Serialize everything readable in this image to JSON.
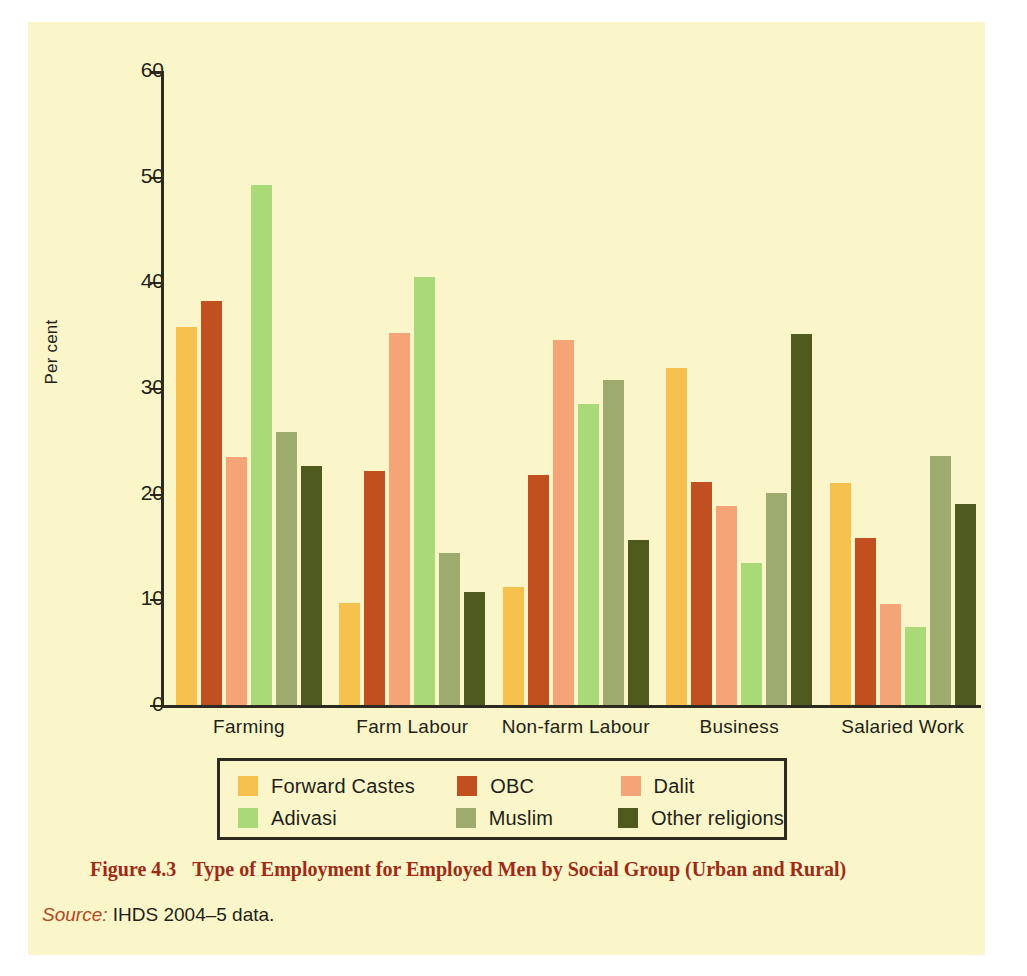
{
  "figure": {
    "caption_number": "Figure 4.3",
    "caption_text": "Type of Employment for Employed Men by Social Group (Urban and Rural)",
    "source_label": "Source:",
    "source_text": "IHDS 2004–5 data."
  },
  "colors": {
    "panel_background": "#fbf6c9",
    "axis": "#2d2a20",
    "caption": "#9e2b16",
    "text": "#231f18",
    "forward_castes": "#f5c04e",
    "obc": "#c24f1f",
    "dalit": "#f4a477",
    "adivasi": "#aada78",
    "muslim": "#9dac६e",
    "other_religions": "#4f5a1e"
  },
  "chart_data": {
    "type": "bar",
    "title": "Type of Employment for Employed Men by Social Group (Urban and Rural)",
    "xlabel": "",
    "ylabel": "Per cent",
    "ylim": [
      0,
      60
    ],
    "yticks": [
      0,
      10,
      20,
      30,
      40,
      50,
      60
    ],
    "ytick_labels": [
      "0",
      "10",
      "20",
      "30",
      "40",
      "50",
      "60"
    ],
    "grid": false,
    "legend_position": "bottom",
    "categories": [
      "Farming",
      "Farm Labour",
      "Non-farm Labour",
      "Business",
      "Salaried Work"
    ],
    "series": [
      {
        "name": "Forward Castes",
        "color": "#f5c04e",
        "values": [
          35.8,
          9.7,
          11.2,
          31.9,
          21.0
        ]
      },
      {
        "name": "OBC",
        "color": "#c24f1f",
        "values": [
          38.2,
          22.1,
          21.8,
          21.1,
          15.8
        ]
      },
      {
        "name": "Dalit",
        "color": "#f4a477",
        "values": [
          23.5,
          35.2,
          34.5,
          18.8,
          9.6
        ]
      },
      {
        "name": "Adivasi",
        "color": "#aada78",
        "values": [
          49.2,
          40.5,
          28.5,
          13.4,
          7.4
        ]
      },
      {
        "name": "Muslim",
        "color": "#9dac6e",
        "values": [
          25.8,
          14.4,
          30.8,
          20.1,
          23.6
        ]
      },
      {
        "name": "Other religions",
        "color": "#4f5a1e",
        "values": [
          22.6,
          10.7,
          15.6,
          35.1,
          19.0
        ]
      }
    ]
  }
}
